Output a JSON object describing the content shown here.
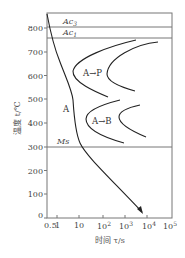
{
  "diagram": {
    "type": "CCT/TTT cooling diagram",
    "y_axis": {
      "label": "温度 t/℃",
      "ticks": [
        "0",
        "100",
        "200",
        "300",
        "400",
        "500",
        "600",
        "700",
        "800"
      ]
    },
    "x_axis": {
      "label": "时间 τ/s",
      "ticks": [
        "0.5",
        "1",
        "10",
        "10",
        "10",
        "10",
        "10"
      ],
      "tick_exponents": [
        "",
        "",
        "",
        "2",
        "3",
        "4",
        "5"
      ]
    },
    "lines": {
      "ac3": "Ac",
      "ac3_sub": "3",
      "ac1": "Ac",
      "ac1_sub": "1",
      "ms": "Ms"
    },
    "regions": {
      "austenite": "A",
      "pearlite": "A→P",
      "bainite": "A→B"
    }
  }
}
